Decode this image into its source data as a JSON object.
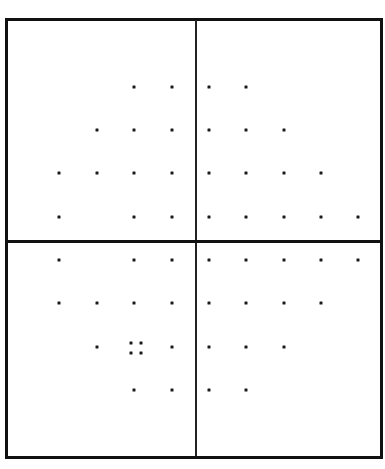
{
  "diagram": {
    "type": "dot-pattern-quadrant-grid",
    "frame": {
      "x": 5,
      "y": 18,
      "width": 378,
      "height": 441,
      "stroke": "#111111"
    },
    "axes": {
      "vertical_x": 196,
      "horizontal_y": 241,
      "color": "#111111"
    },
    "dot_color": "#1a1a1a",
    "columns_x": [
      59,
      97,
      134,
      172,
      209,
      246,
      284,
      321,
      358
    ],
    "rows_y": [
      87,
      130,
      173,
      217,
      260,
      303,
      347,
      390
    ],
    "rows": [
      {
        "y": 87,
        "x": [
          134,
          172,
          209,
          246
        ]
      },
      {
        "y": 130,
        "x": [
          97,
          134,
          172,
          209,
          246,
          284
        ]
      },
      {
        "y": 173,
        "x": [
          59,
          97,
          134,
          172,
          209,
          246,
          284,
          321
        ]
      },
      {
        "y": 217,
        "x": [
          59,
          134,
          172,
          209,
          246,
          284,
          321,
          358
        ]
      },
      {
        "y": 260,
        "x": [
          59,
          134,
          172,
          209,
          246,
          284,
          321,
          358
        ]
      },
      {
        "y": 303,
        "x": [
          59,
          97,
          134,
          172,
          209,
          246,
          284,
          321
        ]
      },
      {
        "y": 347,
        "x": [
          97,
          172,
          209,
          246,
          284
        ]
      },
      {
        "y": 390,
        "x": [
          134,
          172,
          209,
          246
        ]
      }
    ],
    "cluster": {
      "center": [
        136,
        348
      ],
      "dots": [
        [
          131,
          343
        ],
        [
          141,
          343
        ],
        [
          131,
          353
        ],
        [
          141,
          353
        ]
      ]
    }
  }
}
